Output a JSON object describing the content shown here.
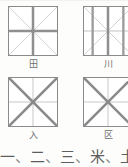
{
  "page": {
    "kind": "chinese-character-practice-grid",
    "background_color": "#fdfdfc",
    "cell_border_color": "#8b8b8b",
    "guide_thin_color": "#cfcfcf",
    "guide_thick_color": "#8f8f8f",
    "label_color": "#6e6e6e"
  },
  "cells": [
    {
      "id": "cell-tian",
      "label": "田",
      "emphasis": "cross",
      "description": "horizontal and vertical center guides emphasized"
    },
    {
      "id": "cell-chuan",
      "label": "川",
      "emphasis": "vertical",
      "description": "vertical guides emphasized"
    },
    {
      "id": "cell-ru",
      "label": "入",
      "emphasis": "diagonal",
      "description": "both diagonal guides emphasized"
    },
    {
      "id": "cell-qu",
      "label": "区",
      "emphasis": "diagonal",
      "description": "both diagonal guides emphasized"
    }
  ],
  "examples": {
    "separator": "、",
    "characters": [
      "一",
      "二",
      "三",
      "米",
      "土",
      "口"
    ],
    "text": "一、二、三、米、土、口"
  }
}
